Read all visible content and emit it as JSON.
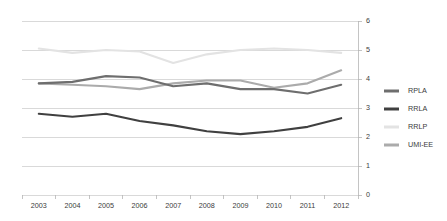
{
  "chart_data": {
    "type": "line",
    "title": "",
    "subtitle": "",
    "xlabel": "",
    "ylabel": "",
    "categories": [
      "2003",
      "2004",
      "2005",
      "2006",
      "2007",
      "2008",
      "2009",
      "2010",
      "2011",
      "2012"
    ],
    "ylim": [
      0,
      6
    ],
    "yticks": [
      "0",
      "1",
      "2",
      "3",
      "4",
      "5",
      "6"
    ],
    "ytick_values": [
      0,
      1,
      2,
      3,
      4,
      5,
      6
    ],
    "grid": true,
    "grid_axis": "y",
    "legend_position": "right",
    "series": [
      {
        "name": "RPLA",
        "color": "#6e6e6e",
        "values": [
          3.85,
          3.9,
          4.1,
          4.05,
          3.75,
          3.85,
          3.65,
          3.65,
          3.5,
          3.8
        ]
      },
      {
        "name": "RRLA",
        "color": "#404040",
        "values": [
          2.8,
          2.7,
          2.8,
          2.55,
          2.4,
          2.2,
          2.1,
          2.2,
          2.35,
          2.65
        ]
      },
      {
        "name": "RRLP",
        "color": "#e3e3e3",
        "values": [
          5.05,
          4.9,
          5.0,
          4.95,
          4.55,
          4.85,
          5.0,
          5.05,
          5.0,
          4.9
        ]
      },
      {
        "name": "UMI-EE",
        "color": "#ababab",
        "values": [
          3.85,
          3.8,
          3.75,
          3.65,
          3.85,
          3.95,
          3.95,
          3.7,
          3.85,
          4.3
        ]
      }
    ]
  },
  "legend": {
    "items": [
      {
        "label": "RPLA"
      },
      {
        "label": "RRLA"
      },
      {
        "label": "RRLP"
      },
      {
        "label": "UMI-EE"
      }
    ]
  },
  "colors": {
    "background": "#ffffff",
    "gridline": "#c9c9c9",
    "axis": "#b5b5b5",
    "text": "#3b3b3b"
  }
}
